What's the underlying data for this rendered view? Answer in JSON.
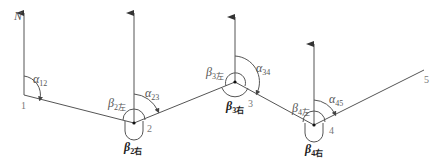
{
  "diagram": {
    "title": "",
    "north_label": "N",
    "points": [
      {
        "id": "1",
        "label": "1",
        "x": 24,
        "y": 95
      },
      {
        "id": "2",
        "label": "2",
        "x": 134,
        "y": 123
      },
      {
        "id": "3",
        "label": "3",
        "x": 235,
        "y": 82
      },
      {
        "id": "4",
        "label": "4",
        "x": 314,
        "y": 125
      },
      {
        "id": "5",
        "label": "5",
        "x": 424,
        "y": 70
      }
    ],
    "azimuths": [
      {
        "symbol": "α",
        "sub": "12"
      },
      {
        "symbol": "α",
        "sub": "23"
      },
      {
        "symbol": "α",
        "sub": "34"
      },
      {
        "symbol": "α",
        "sub": "45"
      }
    ],
    "left_angles": [
      {
        "symbol": "β",
        "sub": "2左"
      },
      {
        "symbol": "β",
        "sub": "3左"
      },
      {
        "symbol": "β",
        "sub": "4左"
      }
    ],
    "right_angles": [
      {
        "symbol": "β",
        "sub": "2右"
      },
      {
        "symbol": "β",
        "sub": "3右"
      },
      {
        "symbol": "β",
        "sub": "4右"
      }
    ],
    "colors": {
      "line": "#555555",
      "text": "#555555",
      "bold_text": "#222222"
    }
  }
}
